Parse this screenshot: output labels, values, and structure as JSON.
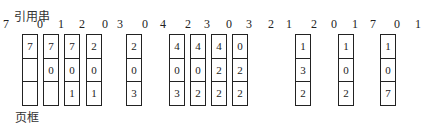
{
  "title": "引用串",
  "footer": "页框",
  "reference_string": [
    "7",
    "0",
    "1",
    "2",
    "0",
    "3",
    "0",
    "4",
    "2",
    "3",
    "0",
    "3",
    "2",
    "1",
    "2",
    "0",
    "1",
    "7",
    "0",
    "1"
  ],
  "reference_positions": [
    6,
    40,
    61,
    82,
    105,
    120,
    145,
    163,
    188,
    207,
    229,
    249,
    271,
    289,
    314,
    334,
    355,
    373,
    397,
    418
  ],
  "frames": [
    {
      "x": 22,
      "cells": [
        "7",
        "",
        ""
      ]
    },
    {
      "x": 43,
      "cells": [
        "7",
        "0",
        ""
      ]
    },
    {
      "x": 64,
      "cells": [
        "7",
        "0",
        "1"
      ]
    },
    {
      "x": 86,
      "cells": [
        "2",
        "0",
        "1"
      ]
    },
    {
      "x": 126,
      "cells": [
        "2",
        "0",
        "3"
      ]
    },
    {
      "x": 169,
      "cells": [
        "4",
        "0",
        "3"
      ]
    },
    {
      "x": 190,
      "cells": [
        "4",
        "0",
        "2"
      ]
    },
    {
      "x": 211,
      "cells": [
        "4",
        "2",
        "2"
      ]
    },
    {
      "x": 232,
      "cells": [
        "0",
        "2",
        "2"
      ]
    },
    {
      "x": 295,
      "cells": [
        "1",
        "3",
        "2"
      ]
    },
    {
      "x": 338,
      "cells": [
        "1",
        "0",
        "2"
      ]
    },
    {
      "x": 380,
      "cells": [
        "1",
        "0",
        "7"
      ]
    }
  ]
}
